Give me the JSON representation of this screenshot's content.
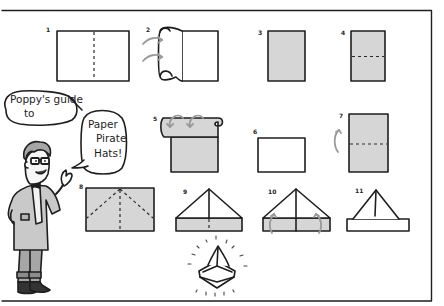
{
  "speech_bubbles": [
    {
      "lines": [
        "Poppy's guide",
        "to"
      ]
    },
    {
      "lines": [
        "Paper",
        "Pirate",
        "Hats!"
      ]
    }
  ],
  "steps": [
    {
      "number": "1",
      "description": "Rectangle sheet with vertical center dashed fold line",
      "shade": "white"
    },
    {
      "number": "2",
      "description": "Fold left half over to the right (curved arrows)",
      "shade": "white"
    },
    {
      "number": "3",
      "description": "Folded portrait rectangle",
      "shade": "gray"
    },
    {
      "number": "4",
      "description": "Portrait rectangle with horizontal dashed fold line",
      "shade": "gray"
    },
    {
      "number": "5",
      "description": "Fold top half down (curved arrows)",
      "shade": "gray"
    },
    {
      "number": "6",
      "description": "Folded landscape rectangle",
      "shade": "white"
    },
    {
      "number": "7",
      "description": "Portrait rectangle with dashed line, arrow up",
      "shade": "gray"
    },
    {
      "number": "8",
      "description": "Rectangle with diagonal dashed corner folds to center",
      "shade": "gray"
    },
    {
      "number": "9",
      "description": "Triangle top with gray band at bottom",
      "shade": "gray"
    },
    {
      "number": "10",
      "description": "Fold bottom band up (curved arrows)",
      "shade": "gray"
    },
    {
      "number": "11",
      "description": "Triangle with white band",
      "shade": "white"
    }
  ],
  "final": {
    "description": "Finished paper pirate hat with sparkle rays"
  },
  "colors": {
    "line": "#1e1e1e",
    "paper_gray": "#d6d6d6",
    "arrow_gray": "#9a9a9a",
    "background": "#ffffff"
  }
}
